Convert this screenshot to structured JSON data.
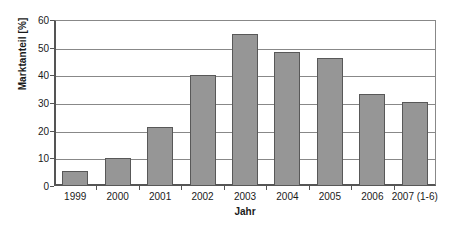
{
  "chart_data": {
    "type": "bar",
    "title": "",
    "subtitle": "",
    "xlabel": "Jahr",
    "ylabel": "Marktanteil [%]",
    "categories": [
      "1999",
      "2000",
      "2001",
      "2002",
      "2003",
      "2004",
      "2005",
      "2006",
      "2007 (1-6)"
    ],
    "values": [
      5.4,
      10.0,
      21.2,
      40.0,
      55.0,
      48.5,
      46.3,
      33.2,
      30.3
    ],
    "ylim": [
      0,
      60
    ],
    "ytick_labels": [
      "60",
      "50",
      "40",
      "30",
      "20",
      "10",
      "0"
    ],
    "ytick_values": [
      60,
      50,
      40,
      30,
      20,
      10,
      0
    ],
    "ytick_step": 10,
    "grid": "horizontal",
    "legend": "none",
    "annotations": [],
    "colors": {
      "bar_fill": "#969696",
      "bar_border": "#585858",
      "gridline": "#888888",
      "axis": "#555555",
      "text": "#1a1a1a",
      "background": "#ffffff"
    }
  }
}
